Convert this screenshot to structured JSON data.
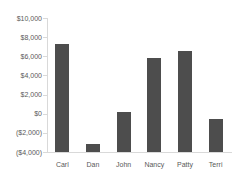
{
  "chart_data": {
    "type": "bar",
    "title": "",
    "categories": [
      "Carl",
      "Dan",
      "John",
      "Nancy",
      "Patty",
      "Terri"
    ],
    "series": [
      {
        "name": "value",
        "values": [
          7300,
          -3200,
          200,
          5800,
          6600,
          -600
        ]
      }
    ],
    "values": [
      7300,
      -3200,
      200,
      5800,
      6600,
      -600
    ],
    "xlabel": "",
    "ylabel": "",
    "ylim": [
      -4000,
      10000
    ],
    "ytick_step": 2000,
    "yticks": [
      10000,
      8000,
      6000,
      4000,
      2000,
      0,
      -2000,
      -4000
    ],
    "ytick_labels": [
      "$10,000",
      "$8,000",
      "$6,000",
      "$4,000",
      "$2,000",
      "$0",
      "($2,000)",
      "($4,000)"
    ],
    "grid": false,
    "legend_position": "none",
    "bars_start_at_axis_minimum": true,
    "colors": {
      "bar": "#4d4d4d",
      "axis_line": "#d9d9d9",
      "tick_mark": "#d9d9d9",
      "label_text": "#595959",
      "background": "#ffffff"
    }
  }
}
